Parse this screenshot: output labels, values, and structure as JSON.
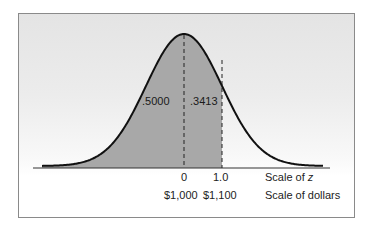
{
  "chart_data": {
    "type": "area",
    "title": "",
    "distribution": "standard normal",
    "mean_z": 0,
    "shaded_regions": [
      {
        "from_z": "-inf",
        "to_z": 0,
        "area_label": ".5000"
      },
      {
        "from_z": 0,
        "to_z": 1.0,
        "area_label": ".3413"
      }
    ],
    "x_axes": [
      {
        "name": "Scale of z",
        "ticks": [
          "0",
          "1.0"
        ]
      },
      {
        "name": "Scale of dollars",
        "ticks": [
          "$1,000",
          "$1,100"
        ]
      }
    ],
    "colors": {
      "shade": "#a8a8a8",
      "curve": "#111111",
      "background_top": "#e4e4e4"
    }
  },
  "labels": {
    "left_area": ".5000",
    "right_area": ".3413",
    "z_tick_0": "0",
    "z_tick_1": "1.0",
    "z_scale": "Scale of ",
    "z_var": "z",
    "dollar_tick_0": "$1,000",
    "dollar_tick_1": "$1,100",
    "dollar_scale": "Scale of dollars"
  }
}
